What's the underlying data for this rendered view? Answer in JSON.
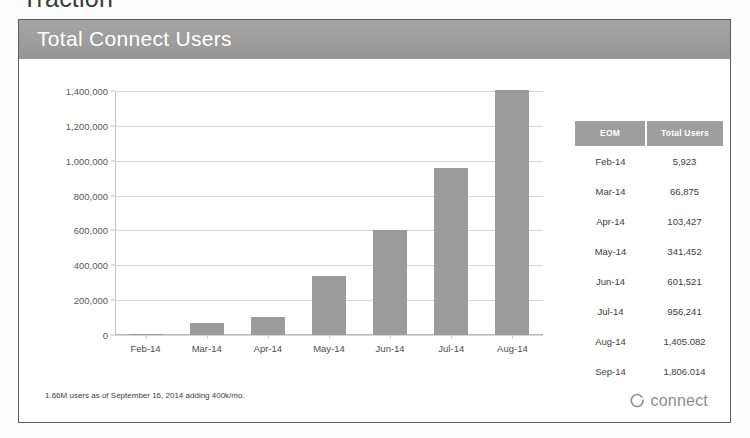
{
  "deck": {
    "section_heading": "Traction"
  },
  "slide": {
    "title": "Total Connect Users",
    "footnote": "1.66M users as of September 16, 2014 adding 400k/mo.",
    "brand_name": "connect",
    "brand_mark_icon": "open-ring-icon",
    "title_bar_color": "#9d9d9d",
    "accent_color": "#9b9b9b"
  },
  "table": {
    "columns": [
      "EOM",
      "Total Users"
    ],
    "rows": [
      {
        "eom": "Feb-14",
        "total_users": "5,923"
      },
      {
        "eom": "Mar-14",
        "total_users": "66,875"
      },
      {
        "eom": "Apr-14",
        "total_users": "103,427"
      },
      {
        "eom": "May-14",
        "total_users": "341,452"
      },
      {
        "eom": "Jun-14",
        "total_users": "601,521"
      },
      {
        "eom": "Jul-14",
        "total_users": "956,241"
      },
      {
        "eom": "Aug-14",
        "total_users": "1,405.082"
      },
      {
        "eom": "Sep-14",
        "total_users": "1,806.014"
      }
    ]
  },
  "chart_data": {
    "type": "bar",
    "title": "Total Connect Users",
    "xlabel": "",
    "ylabel": "",
    "categories": [
      "Feb-14",
      "Mar-14",
      "Apr-14",
      "May-14",
      "Jun-14",
      "Jul-14",
      "Aug-14"
    ],
    "values": [
      5923,
      66875,
      103427,
      341452,
      601521,
      956241,
      1405082
    ],
    "ylim": [
      0,
      1400000
    ],
    "ytick_values": [
      0,
      200000,
      400000,
      600000,
      800000,
      1000000,
      1200000,
      1400000
    ],
    "ytick_labels": [
      "0",
      "200,000",
      "400,000",
      "600,000",
      "800,000",
      "1,000,000",
      "1,200,000",
      "1,400,000"
    ],
    "grid": true,
    "legend": false,
    "bar_color": "#9b9b9b"
  }
}
